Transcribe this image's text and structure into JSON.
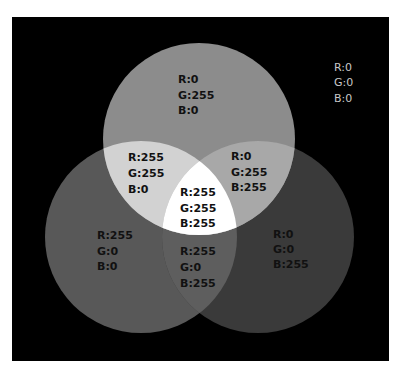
{
  "diagram": {
    "background": "#000000",
    "circles": [
      {
        "id": "green",
        "cx": 199,
        "cy": 139,
        "r": 96,
        "fill": "#8c8c8c"
      },
      {
        "id": "red",
        "cx": 141,
        "cy": 237,
        "r": 96,
        "fill": "#585858"
      },
      {
        "id": "blue",
        "cx": 258,
        "cy": 237,
        "r": 96,
        "fill": "#3a3a3a"
      }
    ],
    "overlaps": {
      "red_green": "#d2d2d2",
      "green_blue": "#a8a8a8",
      "red_blue": "#5e5e5e",
      "all": "#ffffff"
    },
    "regions": [
      {
        "name": "background",
        "lines": [
          "R:0",
          "G:0",
          "B:0"
        ]
      },
      {
        "name": "green",
        "lines": [
          "R:0",
          "G:255",
          "B:0"
        ]
      },
      {
        "name": "yellow",
        "lines": [
          "R:255",
          "G:255",
          "B:0"
        ]
      },
      {
        "name": "cyan",
        "lines": [
          "R:0",
          "G:255",
          "B:255"
        ]
      },
      {
        "name": "white",
        "lines": [
          "R:255",
          "G:255",
          "B:255"
        ]
      },
      {
        "name": "red",
        "lines": [
          "R:255",
          "G:0",
          "B:0"
        ]
      },
      {
        "name": "magenta",
        "lines": [
          "R:255",
          "G:0",
          "B:255"
        ]
      },
      {
        "name": "blue",
        "lines": [
          "R:0",
          "G:0",
          "B:255"
        ]
      }
    ]
  }
}
